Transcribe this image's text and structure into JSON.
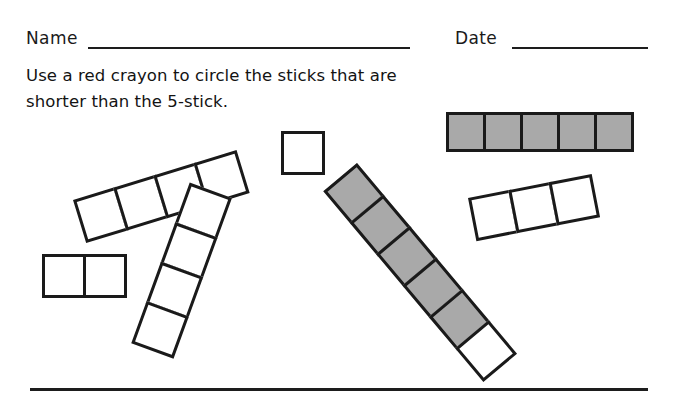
{
  "worksheet": {
    "header": {
      "name_label": "Name",
      "date_label": "Date"
    },
    "instruction": {
      "line1": "Use a red crayon to circle the sticks that are",
      "line2": "shorter than the 5-stick."
    },
    "colors": {
      "ink": "#1a1a1a",
      "cube_fill_gray": "#a9a9a9",
      "cube_fill_white": "#ffffff",
      "page": "#ffffff"
    },
    "sticks": [
      {
        "id": "reference-5-stick",
        "cells": 5,
        "fills": [
          "gray",
          "gray",
          "gray",
          "gray",
          "gray"
        ],
        "cell_size": 40,
        "left": 446,
        "top": 112,
        "rotation_deg": 0,
        "is_reference": true
      },
      {
        "id": "stick-4-top-left",
        "cells": 4,
        "fills": [
          "white",
          "white",
          "white",
          "white"
        ],
        "cell_size": 45,
        "left": 73,
        "top": 200,
        "rotation_deg": -17,
        "is_reference": false
      },
      {
        "id": "stick-1-single-square",
        "cells": 1,
        "fills": [
          "white"
        ],
        "cell_size": 44,
        "left": 281,
        "top": 131,
        "rotation_deg": 0,
        "is_reference": false
      },
      {
        "id": "stick-2-left",
        "cells": 2,
        "fills": [
          "white",
          "white"
        ],
        "cell_size": 44,
        "left": 42,
        "top": 254,
        "rotation_deg": 0,
        "is_reference": false
      },
      {
        "id": "stick-4-middle-diagonal",
        "cells": 4,
        "fills": [
          "white",
          "white",
          "white",
          "white"
        ],
        "cell_size": 45,
        "left": 232,
        "top": 198,
        "rotation_deg": 110,
        "is_reference": false
      },
      {
        "id": "stick-6-large-diagonal",
        "cells": 6,
        "fills": [
          "gray",
          "gray",
          "gray",
          "gray",
          "gray",
          "white"
        ],
        "cell_size": 44,
        "left": 357,
        "top": 163,
        "rotation_deg": 50,
        "is_reference": false
      },
      {
        "id": "stick-3-right",
        "cells": 3,
        "fills": [
          "white",
          "white",
          "white"
        ],
        "cell_size": 44,
        "left": 468,
        "top": 198,
        "rotation_deg": -11,
        "is_reference": false
      }
    ]
  }
}
